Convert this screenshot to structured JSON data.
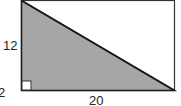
{
  "diagram": {
    "type": "geometry",
    "labels": {
      "height": "12",
      "base": "20",
      "partial_left": "2"
    },
    "colors": {
      "shade": "#a6a6a6",
      "stroke": "#1a1a1a",
      "background": "#ffffff"
    }
  }
}
